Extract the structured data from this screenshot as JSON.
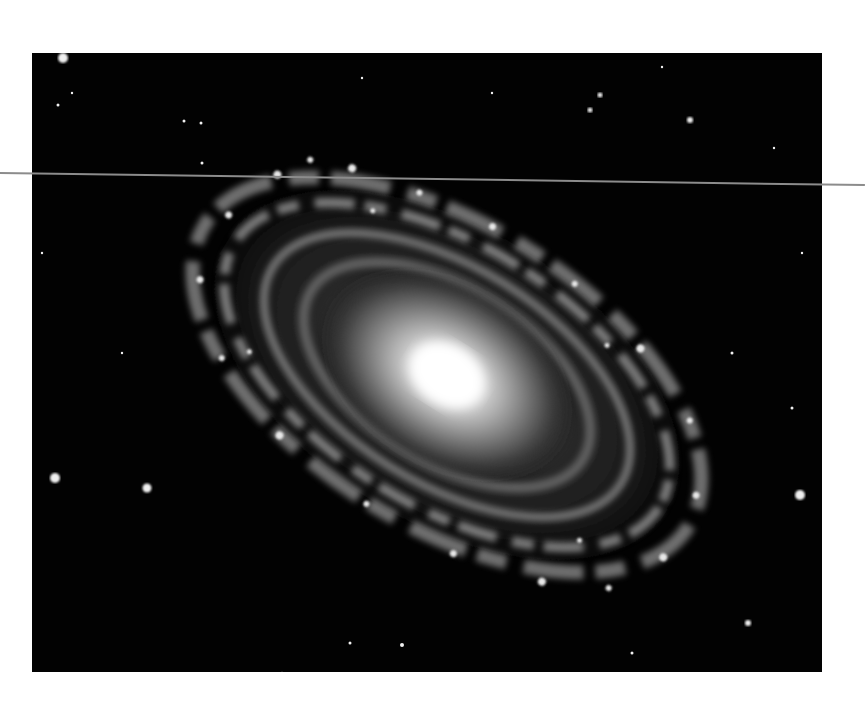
{
  "scene": {
    "subject": "spiral galaxy",
    "description": "Grayscale photograph of a barred-looking spiral galaxy with a bright core and dusty spiral arms, printed on white paper with a thin grey line across the upper part",
    "colors": {
      "paper": "#ffffff",
      "space": "#020202",
      "core": "#ffffff",
      "arms": "#b8b8b8",
      "line": "#8c8c8c"
    },
    "photo_frame": {
      "x": 32,
      "y": 53,
      "width": 790,
      "height": 619
    },
    "galaxy_center": {
      "x": 447,
      "y": 375
    },
    "stars": [
      {
        "x": 55,
        "y": 478,
        "r": 5
      },
      {
        "x": 147,
        "y": 488,
        "r": 5
      },
      {
        "x": 800,
        "y": 495,
        "r": 5
      },
      {
        "x": 690,
        "y": 120,
        "r": 3
      },
      {
        "x": 600,
        "y": 95,
        "r": 2.5
      },
      {
        "x": 590,
        "y": 110,
        "r": 2.5
      },
      {
        "x": 748,
        "y": 623,
        "r": 3
      },
      {
        "x": 63,
        "y": 58,
        "r": 5
      }
    ]
  }
}
